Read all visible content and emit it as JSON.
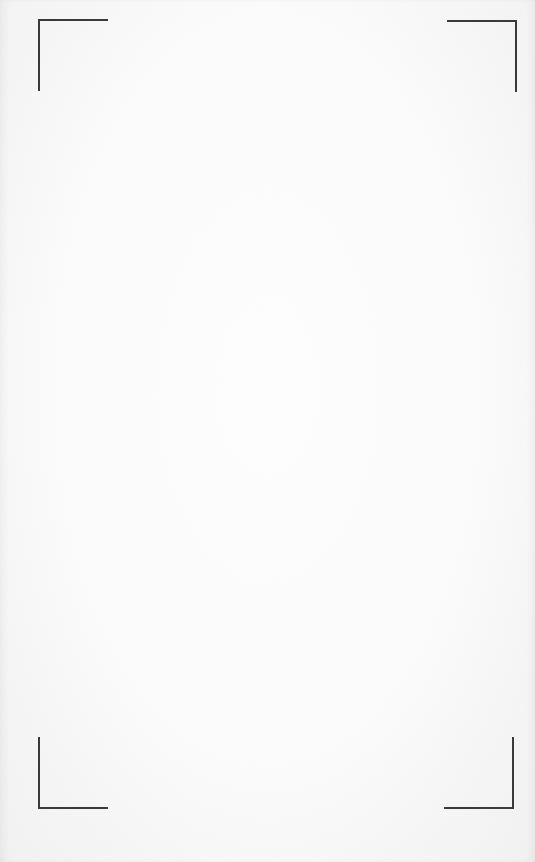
{
  "page": {
    "background_color": "#fbfbfb",
    "crop_mark_color": "#3a3a3a",
    "content": ""
  },
  "crop_marks": [
    {
      "position": "top-left"
    },
    {
      "position": "top-right"
    },
    {
      "position": "bottom-left"
    },
    {
      "position": "bottom-right"
    }
  ]
}
